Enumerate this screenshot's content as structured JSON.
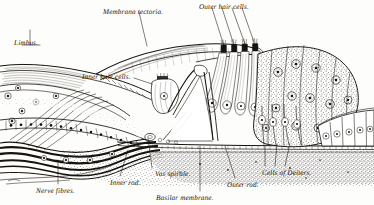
{
  "figure": {
    "style": "engraving",
    "ink_color": "#17140f",
    "paper_color": "#fdfdfb"
  },
  "labels": [
    {
      "id": "limbus",
      "text": "Limbus.",
      "x": 14,
      "y": 40,
      "anchor": "start"
    },
    {
      "id": "membrana-tectoria",
      "text": "Membrana tectoria.",
      "x": 103,
      "y": 9,
      "anchor": "start"
    },
    {
      "id": "outer-hair-cells",
      "text": "Outer hair cells.",
      "x": 199,
      "y": 4,
      "anchor": "start"
    },
    {
      "id": "inner-hair-cells",
      "text": "Inner hair cells.",
      "x": 82,
      "y": 74,
      "anchor": "start"
    },
    {
      "id": "nerve-fibres",
      "text": "Nerve fibres.",
      "x": 36,
      "y": 188,
      "anchor": "start"
    },
    {
      "id": "inner-rod",
      "text": "Inner rod.",
      "x": 110,
      "y": 180,
      "anchor": "start"
    },
    {
      "id": "vas-spirale",
      "text": "Vas spirale.",
      "x": 155,
      "y": 171,
      "anchor": "start"
    },
    {
      "id": "basilar-membrane",
      "text": "Basilar membrane.",
      "x": 156,
      "y": 195,
      "anchor": "start"
    },
    {
      "id": "outer-rod",
      "text": "Outer rod.",
      "x": 227,
      "y": 182,
      "anchor": "start"
    },
    {
      "id": "cells-of-deiters",
      "text": "Cells of Deiters.",
      "x": 262,
      "y": 170,
      "anchor": "start"
    }
  ],
  "leaders": [
    {
      "id": "leader-limbus",
      "points": "30,45 30,30"
    },
    {
      "id": "leader-limbus-2",
      "points": "22,45 40,45"
    },
    {
      "id": "leader-membrana-tectoria",
      "points": "139,12 147,46"
    },
    {
      "id": "leader-ohc-1",
      "points": "212,8 224,46"
    },
    {
      "id": "leader-ohc-2",
      "points": "222,8 234,45"
    },
    {
      "id": "leader-ohc-3",
      "points": "232,8 245,44"
    },
    {
      "id": "leader-ohc-4",
      "points": "242,8 254,42"
    },
    {
      "id": "leader-inner-hair-cells",
      "points": "134,78 152,84"
    },
    {
      "id": "leader-nerve-fibres",
      "points": "58,184 58,160"
    },
    {
      "id": "leader-inner-rod",
      "points": "120,176 128,150"
    },
    {
      "id": "leader-vas-spirale",
      "points": "152,168 148,138"
    },
    {
      "id": "leader-basilar-membrane",
      "points": "200,191 200,146"
    },
    {
      "id": "leader-outer-rod",
      "points": "235,178 225,146"
    },
    {
      "id": "leader-deiters-1",
      "points": "265,166 265,146"
    },
    {
      "id": "leader-deiters-2",
      "points": "275,166 277,144"
    },
    {
      "id": "leader-deiters-3",
      "points": "285,166 290,143"
    }
  ],
  "structures": [
    {
      "id": "limbus-spiral-lamina",
      "name": "Limbus / spiral lamina"
    },
    {
      "id": "membrana-tectoria",
      "name": "Membrana tectoria"
    },
    {
      "id": "tunnel-of-corti",
      "name": "Tunnel of Corti"
    },
    {
      "id": "inner-rod",
      "name": "Inner rod of Corti"
    },
    {
      "id": "outer-rod",
      "name": "Outer rod of Corti"
    },
    {
      "id": "basilar-membrane",
      "name": "Basilar membrane"
    },
    {
      "id": "nerve-fibres",
      "name": "Cochlear nerve fibres"
    },
    {
      "id": "vas-spirale",
      "name": "Vas spirale"
    },
    {
      "id": "hensens-cells",
      "name": "Cells of Hensen"
    },
    {
      "id": "claudius-cells",
      "name": "Cells of Claudius"
    },
    {
      "id": "deiters-cells",
      "name": "Cells of Deiters"
    }
  ]
}
